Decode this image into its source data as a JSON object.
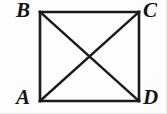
{
  "figure": {
    "kind": "square-with-diagonals",
    "stroke_color": "#1a1a1a",
    "stroke_width": 2.6,
    "background_color": "#fdfdfd",
    "square": {
      "top_left": [
        40,
        12
      ],
      "top_right": [
        139,
        12
      ],
      "bottom_right": [
        139,
        101
      ],
      "bottom_left": [
        40,
        101
      ]
    },
    "diagonals": [
      {
        "name": "diagonal-B-D",
        "from": [
          40,
          12
        ],
        "to": [
          139,
          101
        ]
      },
      {
        "name": "diagonal-A-C",
        "from": [
          40,
          101
        ],
        "to": [
          139,
          12
        ]
      }
    ],
    "intersection_point": [
      89,
      57
    ],
    "labels": {
      "top_left": "B",
      "top_right": "C",
      "bottom_left": "A",
      "bottom_right": "D"
    }
  }
}
